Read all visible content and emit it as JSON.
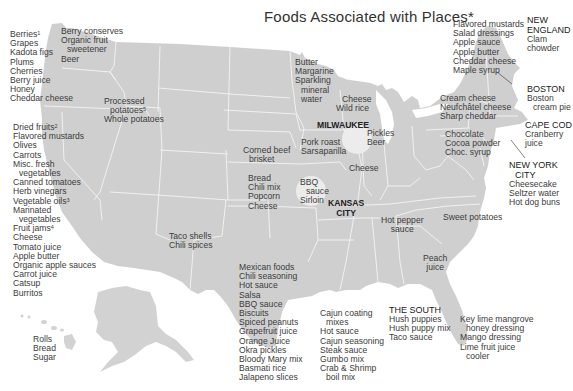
{
  "title": "Foods Associated with Places*",
  "colors": {
    "land": "#cfcfcf",
    "borders": "#f4f4f4",
    "circle": "#ececec",
    "text": "#3c3c3c",
    "background": "#ffffff"
  },
  "regions": {
    "west_coast": {
      "items": [
        "Berries",
        "Grapes",
        "Kadota figs",
        "Plums",
        "Cherries",
        "Berry juice",
        "Honey",
        "Cheddar cheese"
      ],
      "sup": {
        "0": "1"
      }
    },
    "washington_idaho": {
      "items": [
        "Berry conserves",
        "Organic fruit",
        "sweetener",
        "Beer"
      ]
    },
    "idaho": {
      "items": [
        "Processed",
        "potatoes",
        "Whole potatoes"
      ],
      "sup": {
        "1": "5"
      }
    },
    "california": {
      "items": [
        "Dried fruits",
        "Flavored mustards",
        "Olives",
        "Carrots",
        "Misc. fresh",
        "vegetables",
        "Canned tomatoes",
        "Herb vinegars",
        "Vegetable oils",
        "Marinated",
        "vegetables",
        "Fruit jams",
        "Cheese",
        "Tomato juice",
        "Apple butter",
        "Organic apple sauces",
        "Carrot juice",
        "Catsup",
        "Burritos"
      ],
      "sup": {
        "0": "2",
        "8": "3",
        "11": "4"
      }
    },
    "hawaii": {
      "items": [
        "Rolls",
        "Bread",
        "Sugar"
      ]
    },
    "minnesota": {
      "items": [
        "Butter",
        "Margarine",
        "Sparkling",
        "mineral",
        "water"
      ]
    },
    "wisconsin": {
      "items": [
        "Cheese",
        "Wild rice"
      ]
    },
    "milwaukee": {
      "name": "MILWAUKEE",
      "items": [
        "Pickles",
        "Beer"
      ]
    },
    "iowa": {
      "items": [
        "Pork roast",
        "Sarsaparilla"
      ]
    },
    "illinois": {
      "items": [
        "Cheese"
      ]
    },
    "nebraska": {
      "items": [
        "Corned beef",
        "brisket"
      ]
    },
    "kansas": {
      "items": [
        "Bread",
        "Chili mix",
        "Popcorn",
        "Cheese"
      ]
    },
    "kansas_city": {
      "name": "KANSAS\nCITY",
      "name_lines": [
        "KANSAS",
        "CITY"
      ],
      "items": [
        "BBQ",
        "sauce",
        "Sirloin"
      ]
    },
    "new_mexico": {
      "items": [
        "Taco shells",
        "Chili spices"
      ]
    },
    "texas": {
      "items": [
        "Mexican foods",
        "Chili seasoning",
        "Hot sauce",
        "Salsa",
        "BBQ sauce",
        "Biscuits",
        "Spiced peanuts",
        "Grapefruit juice",
        "Orange Juice",
        "Okra pickles",
        "Bloody Mary mix",
        "Basmati rice",
        "Jalapeno slices"
      ]
    },
    "louisiana": {
      "items": [
        "Cajun coating",
        "mixes",
        "Hot sauce",
        "Cajun seasoning",
        "Steak sauce",
        "Gumbo mix",
        "Crab & Shrimp",
        "boil mix"
      ]
    },
    "the_south": {
      "name": "THE SOUTH",
      "items": [
        "Hush puppies",
        "Hush puppy mix",
        "Taco sauce"
      ]
    },
    "florida": {
      "items": [
        "Key lime mangrove",
        "honey dressing",
        "Mango dressing",
        "Lime fruit juice",
        "cooler"
      ]
    },
    "tennessee": {
      "items": [
        "Hot pepper",
        "sauce"
      ]
    },
    "north_carolina": {
      "items": [
        "Sweet potatoes"
      ]
    },
    "georgia": {
      "items": [
        "Peach",
        "juice"
      ]
    },
    "pennsylvania": {
      "items": [
        "Chocolate",
        "Cocoa powder",
        "Choc. syrup"
      ]
    },
    "new_york_state": {
      "items": [
        "Cream cheese",
        "Neufchâtel cheese",
        "Sharp cheddar"
      ]
    },
    "vermont": {
      "items": [
        "Flavored mustards",
        "Salad dressings",
        "Apple sauce",
        "Apple butter",
        "Cheddar cheese",
        "Maple syrup"
      ]
    },
    "new_england": {
      "name_lines": [
        "NEW",
        "ENGLAND"
      ],
      "items": [
        "Clam",
        "chowder"
      ]
    },
    "boston": {
      "name": "BOSTON",
      "items": [
        "Boston",
        "cream pie"
      ]
    },
    "cape_cod": {
      "name": "CAPE COD",
      "items": [
        "Cranberry",
        "juice"
      ]
    },
    "new_york_city": {
      "name_lines": [
        "NEW YORK",
        "CITY"
      ],
      "items": [
        "Cheesecake",
        "Seltzer water",
        "Hot dog buns"
      ]
    }
  }
}
